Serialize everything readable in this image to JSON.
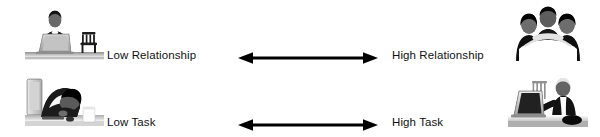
{
  "figure": {
    "background_color": "#ffffff",
    "text_color": "#111111",
    "arrow_color": "#000000",
    "width": 600,
    "height": 137
  },
  "rows": [
    {
      "id": "relationship",
      "dimension": "Relationship",
      "low_label": "Low Relationship",
      "high_label": "High Relationship",
      "arrow": {
        "name": "double-headed-arrow",
        "direction": "bidirectional",
        "glyph": "↔"
      },
      "left_photo": {
        "name": "photo-man-alone-at-laptop-with-empty-chair",
        "alt": "Man working alone at a laptop beside an empty chair",
        "style": "grayscale"
      },
      "right_photo": {
        "name": "photo-team-group-hug",
        "alt": "Group of colleagues in a close group hug",
        "style": "grayscale"
      }
    },
    {
      "id": "task",
      "dimension": "Task",
      "low_label": "Low Task",
      "high_label": "High Task",
      "arrow": {
        "name": "double-headed-arrow",
        "direction": "bidirectional",
        "glyph": "↔"
      },
      "left_photo": {
        "name": "photo-person-asleep-slumped-at-desk",
        "alt": "Person slumped asleep over a desk next to a monitor",
        "style": "grayscale"
      },
      "right_photo": {
        "name": "photo-person-working-actively-at-laptop",
        "alt": "Person working actively at a laptop on a desk",
        "style": "grayscale"
      }
    }
  ]
}
